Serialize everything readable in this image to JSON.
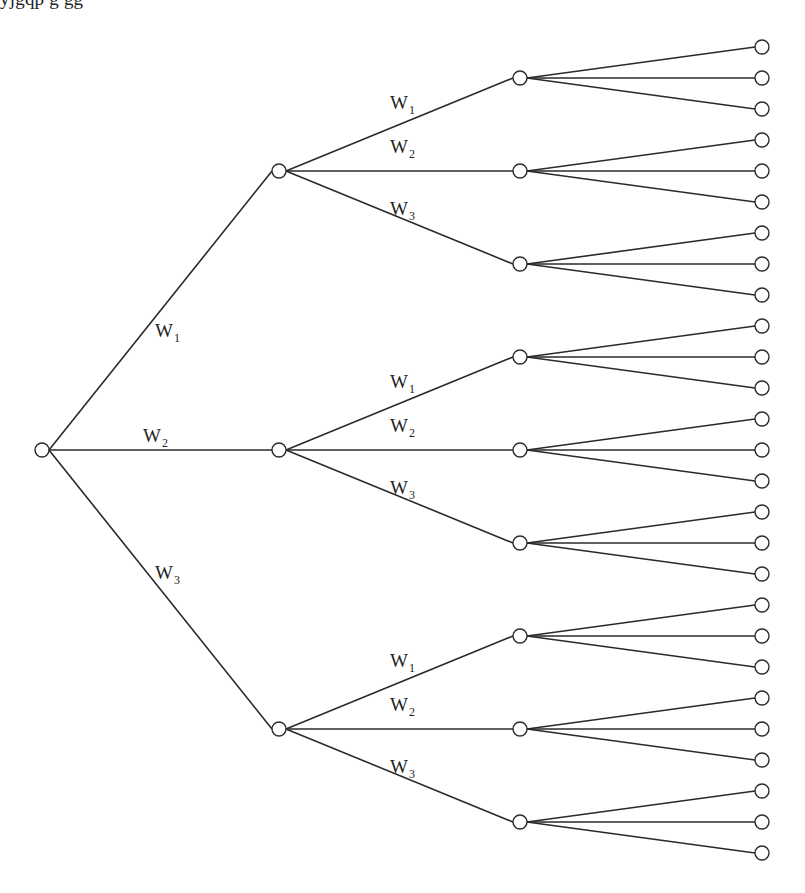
{
  "diagram": {
    "type": "tree",
    "edge_labels": [
      "W",
      "W",
      "W"
    ],
    "edge_label_subscripts": [
      "1",
      "2",
      "3"
    ],
    "levels": 3,
    "branching_factor": 3,
    "leaf_count": 27,
    "root": {
      "x": 42,
      "y": 450
    },
    "level1_x": 279,
    "level2_x": 520,
    "leaf_x": 762,
    "node_radius": 7,
    "colors": {
      "line": "#2a2a2a",
      "background": "#ffffff",
      "text": "#222222"
    }
  },
  "top_clipped_text": "yjgqp g gg"
}
